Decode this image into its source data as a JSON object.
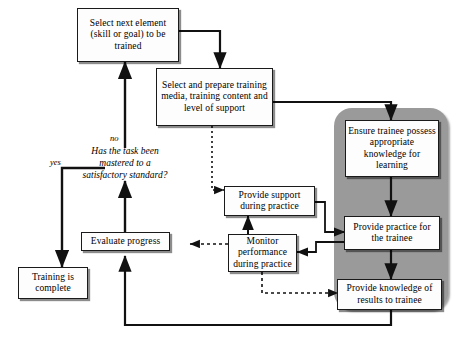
{
  "diagram": {
    "panel_color": "#9a9a9a",
    "node_fill": "#fdfdfd",
    "line_color": "#111111"
  },
  "nodes": {
    "select_element": "Select next element (skill or goal) to be trained",
    "select_media": "Select and prepare training media, training content and level of support",
    "ensure_knowledge": "Ensure trainee possess appropriate knowledge for learning",
    "provide_practice": "Provide practice for the trainee",
    "provide_knowledge_results": "Provide knowledge of results to trainee",
    "provide_support": "Provide support during practice",
    "monitor_performance": "Monitor performance during practice",
    "evaluate_progress": "Evaluate progress",
    "training_complete": "Training is complete"
  },
  "decision": {
    "question": "Has the task been mastered to a satisfactory standard?"
  },
  "edge_labels": {
    "no": "no",
    "yes": "yes"
  }
}
